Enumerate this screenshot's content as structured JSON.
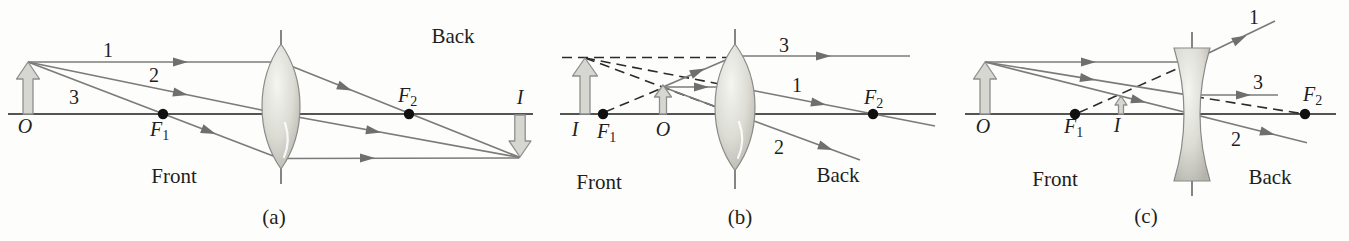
{
  "colors": {
    "background": "#fdfdfb",
    "ray": "#7b7b7b",
    "axis": "#545454",
    "dashed_line": "#2b2b2b",
    "arrowhead": "#6f6f6f",
    "block_arrow_fill": "#d7d7d1",
    "block_arrow_stroke": "#8e8e8e",
    "lens_edge": "#8a8a8a",
    "focal_dot": "#101010",
    "text": "#1e1e1e"
  },
  "panels": [
    {
      "caption": "(a)",
      "lens_type": "converging",
      "front_label": "Front",
      "back_label": "Back",
      "object_label": "O",
      "image_label": "I",
      "focal_front": {
        "base": "F",
        "sub": "1"
      },
      "focal_back": {
        "base": "F",
        "sub": "2"
      },
      "rays": {
        "r1": "1",
        "r2": "2",
        "r3": "3"
      }
    },
    {
      "caption": "(b)",
      "lens_type": "converging",
      "front_label": "Front",
      "back_label": "Back",
      "object_label": "O",
      "image_label": "I",
      "focal_front": {
        "base": "F",
        "sub": "1"
      },
      "focal_back": {
        "base": "F",
        "sub": "2"
      },
      "rays": {
        "r1": "1",
        "r2": "2",
        "r3": "3"
      }
    },
    {
      "caption": "(c)",
      "lens_type": "diverging",
      "front_label": "Front",
      "back_label": "Back",
      "object_label": "O",
      "image_label": "I",
      "focal_front": {
        "base": "F",
        "sub": "1"
      },
      "focal_back": {
        "base": "F",
        "sub": "2"
      },
      "rays": {
        "r1": "1",
        "r2": "2",
        "r3": "3"
      }
    }
  ]
}
